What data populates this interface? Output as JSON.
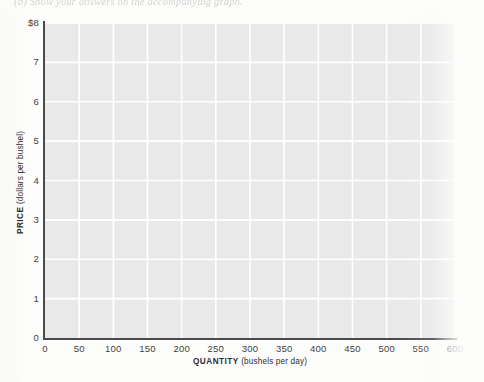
{
  "header": {
    "text": "(b)  Show your answers on the accompanying graph."
  },
  "chart_data": {
    "type": "line",
    "title": "",
    "subtitle": "",
    "xlabel_bold": "QUANTITY",
    "xlabel_rest": " (bushels per day)",
    "ylabel_bold": "PRICE",
    "ylabel_rest": " (dollars per bushel)",
    "x_tick_labels": [
      "0",
      "50",
      "100",
      "150",
      "200",
      "250",
      "300",
      "350",
      "400",
      "450",
      "500",
      "550",
      "600"
    ],
    "x_tick_values": [
      0,
      50,
      100,
      150,
      200,
      250,
      300,
      350,
      400,
      450,
      500,
      550,
      600
    ],
    "y_tick_labels": [
      "$8",
      "7",
      "6",
      "5",
      "4",
      "3",
      "2",
      "1",
      "0"
    ],
    "y_tick_values": [
      8,
      7,
      6,
      5,
      4,
      3,
      2,
      1,
      0
    ],
    "xlim": [
      0,
      600
    ],
    "ylim": [
      0,
      8
    ],
    "grid": true,
    "grid_color": "#ffffff",
    "plot_background": "#e9e9e9",
    "axis_color": "#4a4a4a",
    "legend": [],
    "series": [],
    "annotations": [],
    "note": "empty grid - no data plotted"
  },
  "colors": {
    "page_background": "#fdfdfc",
    "plot_fill": "#e9e9e9",
    "gridline": "#ffffff",
    "axis": "#4a4a4a",
    "tick_text": "#3f3f3f"
  }
}
